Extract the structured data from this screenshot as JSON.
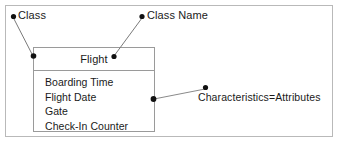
{
  "diagram": {
    "title_class_box": "Flight",
    "attributes": [
      "Boarding Time",
      "Flight Date",
      "Gate",
      "Check-In Counter"
    ],
    "annotations": [
      {
        "id": "class",
        "label": "Class"
      },
      {
        "id": "class-name",
        "label": "Class Name"
      },
      {
        "id": "characteristics",
        "label": "Characteristics=Attributes"
      }
    ],
    "colors": {
      "frame_border": "#b9b9b9",
      "box_border": "#9a9a9a",
      "leader_line": "#7a7a7a",
      "marker_dot": "#111111",
      "text": "#1a1a1a",
      "background": "#ffffff"
    }
  }
}
